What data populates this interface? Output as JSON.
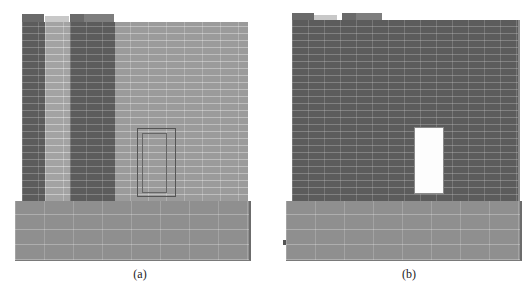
{
  "figure": {
    "panels": [
      {
        "id": "a",
        "label": "(a)",
        "description": "Brick wall on block base with outlined (closed) window and darker brick columns",
        "colors": {
          "wall": "#9b9b9b",
          "columns": "#5c5c5c",
          "base": "#8f8f8f",
          "window_outline": "#555555"
        }
      },
      {
        "id": "b",
        "label": "(b)",
        "description": "Dark brick wall on block base with open (white) window",
        "colors": {
          "wall": "#5c5c5c",
          "base": "#8f8f8f",
          "window_opening": "#fdfdfd"
        }
      }
    ]
  }
}
